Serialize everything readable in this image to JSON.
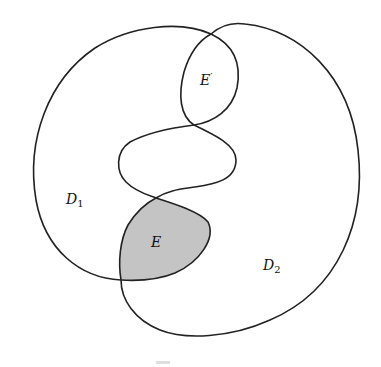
{
  "figure": {
    "type": "set-region diagram",
    "regions": [
      {
        "id": "D1",
        "name": "D",
        "subscript": "1"
      },
      {
        "id": "D2",
        "name": "D",
        "subscript": "2"
      },
      {
        "id": "E",
        "name": "E",
        "shaded": true
      },
      {
        "id": "Eprime",
        "name": "E",
        "prime": "′",
        "shaded": false
      }
    ],
    "colors": {
      "stroke": "#222222",
      "shade": "#c4c4c4",
      "background": "#ffffff"
    }
  },
  "labels": {
    "d1_main": "D",
    "d1_sub": "1",
    "d2_main": "D",
    "d2_sub": "2",
    "e": "E",
    "eprime_main": "E",
    "eprime_mark": "′"
  }
}
